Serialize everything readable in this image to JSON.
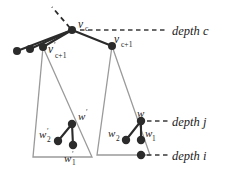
{
  "figure": {
    "background": "#ffffff",
    "node_color": "#2b2b2b",
    "triangle_color": "#9a9a9a",
    "labels": {
      "v_c": "v",
      "v_c_sub": "c",
      "v_cplus1": "v",
      "v_cplus1_sub": "c+1",
      "v_prime_cplus1": "v",
      "v_prime_cplus1_prime": "′",
      "v_prime_cplus1_sub": "c+1",
      "w": "w",
      "w_prime": "w",
      "w_prime_mark": "′",
      "w1": "w",
      "w1_sub": "1",
      "w2": "w",
      "w2_sub": "2",
      "w1_prime": "w",
      "w1_prime_mark": "′",
      "w1_prime_sub": "1",
      "w2_prime": "w",
      "w2_prime_mark": "′",
      "w2_prime_sub": "2",
      "depth_c": "depth c",
      "depth_j": "depth j",
      "depth_i": "depth i"
    },
    "nodes": [
      {
        "name": "v-c",
        "x": 72,
        "y": 30,
        "r": 4.0
      },
      {
        "name": "v-prime-c-plus-1",
        "x": 43,
        "y": 47,
        "r": 4.0
      },
      {
        "name": "sibling-left-1",
        "x": 17,
        "y": 51,
        "r": 4.0
      },
      {
        "name": "sibling-left-2",
        "x": 30,
        "y": 49,
        "r": 4.0
      },
      {
        "name": "v-c-plus-1",
        "x": 112,
        "y": 46,
        "r": 4.0
      },
      {
        "name": "w-prime",
        "x": 72,
        "y": 124,
        "r": 4.2
      },
      {
        "name": "w-prime-1",
        "x": 73,
        "y": 145,
        "r": 4.2
      },
      {
        "name": "w-prime-2",
        "x": 58,
        "y": 141,
        "r": 4.2
      },
      {
        "name": "w",
        "x": 141,
        "y": 121,
        "r": 4.2
      },
      {
        "name": "w-1",
        "x": 141,
        "y": 140,
        "r": 4.2
      },
      {
        "name": "w-2",
        "x": 126,
        "y": 140,
        "r": 4.2
      },
      {
        "name": "depth-i-node",
        "x": 141,
        "y": 155,
        "r": 4.2
      }
    ],
    "depth_lines": [
      {
        "name": "depth-c-line",
        "x1": 80,
        "y": 30,
        "x2": 168
      },
      {
        "name": "depth-j-line",
        "x1": 144,
        "y": 121,
        "x2": 168
      },
      {
        "name": "depth-i-line",
        "x1": 146,
        "y": 155,
        "x2": 168
      }
    ],
    "depth_label_positions": [
      {
        "name": "depth-c-label",
        "x": 172,
        "y": 35
      },
      {
        "name": "depth-j-label",
        "x": 172,
        "y": 126
      },
      {
        "name": "depth-i-label",
        "x": 172,
        "y": 160
      }
    ],
    "triangles": [
      {
        "name": "left-subtree-triangle",
        "apex_x": 43,
        "apex_y": 47,
        "bl_x": 33,
        "bl_y": 157,
        "br_x": 92,
        "br_y": 157
      },
      {
        "name": "right-subtree-triangle",
        "apex_x": 112,
        "apex_y": 46,
        "bl_x": 97,
        "bl_y": 155,
        "br_x": 150,
        "br_y": 155
      }
    ]
  }
}
